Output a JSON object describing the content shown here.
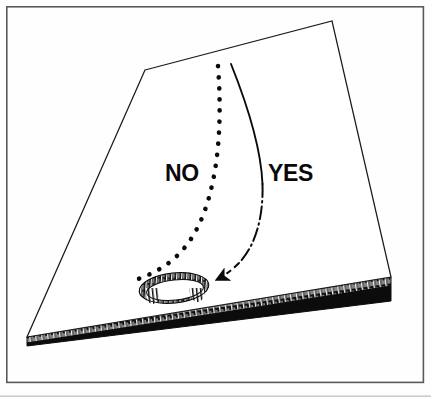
{
  "figure": {
    "type": "line-drawing",
    "background_color": "#fefefe",
    "ink_color": "#0a0a0a",
    "frame": {
      "name": "border-frame",
      "x": 6,
      "y": 6,
      "width": 418,
      "height": 377,
      "stroke_color": "#5a5a5a",
      "stroke_width": 1.6
    },
    "bottom_artifact_line": {
      "y": 396,
      "color": "#b8b8b8"
    },
    "board": {
      "name": "wooden-board",
      "top_face_color": "#ffffff",
      "edge_color": "#0a0a0a",
      "outline_stroke": "#1a1a1a",
      "top_face_points": "145,70 332,21 391,277 27,337",
      "side_face_points": "391,277 391,301 27,346 27,337",
      "hatch_band_points": "391,277 391,285 27,342 27,337"
    },
    "hole": {
      "name": "drilled-hole",
      "center_x": 174,
      "center_y": 288,
      "radius_x": 33,
      "radius_y": 13,
      "rotation_deg": -6,
      "rim_color": "#121212",
      "interior_color": "#ffffff",
      "rim_thickness": 5
    },
    "paths": [
      {
        "name": "no-path",
        "label": "NO",
        "style": "dotted",
        "verdict": "incorrect",
        "start_x": 218,
        "start_y": 66,
        "end_x": 138,
        "end_y": 279,
        "d": "M 218,66 C 222,120 219,170 205,210 C 192,247 170,268 138,279"
      },
      {
        "name": "yes-path",
        "label": "YES",
        "style": "solid-to-dashed",
        "verdict": "correct",
        "start_x": 231,
        "start_y": 64,
        "end_x": 211,
        "end_y": 281,
        "has_arrowhead": true,
        "d": "M 231,64 C 250,110 266,160 262,205 C 258,248 240,272 211,281"
      }
    ],
    "labels": [
      {
        "name": "label-no",
        "text": "NO",
        "x": 165,
        "y": 181,
        "anchor": "start"
      },
      {
        "name": "label-yes",
        "text": "YES",
        "x": 268,
        "y": 181,
        "anchor": "start"
      }
    ]
  }
}
